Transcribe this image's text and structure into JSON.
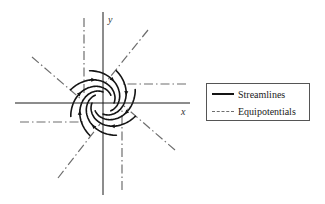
{
  "figure": {
    "type": "spiral vortex flow net",
    "axes": {
      "x_label": "x",
      "y_label": "y",
      "origin": [
        103,
        103
      ],
      "x_extent": [
        15,
        190
      ],
      "y_extent": [
        12,
        195
      ]
    },
    "streamlines": {
      "count": 8,
      "color": "#141414",
      "style": "solid",
      "flow_direction": "clockwise, spiraling inward"
    },
    "equipotentials": {
      "count": 8,
      "color": "#6e6e6e",
      "style": "dash-dot",
      "segments": [
        {
          "from": [
            20,
            122
          ],
          "to": [
            86,
            122
          ]
        },
        {
          "from": [
            84,
            18
          ],
          "to": [
            84,
            96
          ]
        },
        {
          "from": [
            186,
            84
          ],
          "to": [
            120,
            84
          ]
        },
        {
          "from": [
            122,
            190
          ],
          "to": [
            122,
            110
          ]
        },
        {
          "from": [
            32,
            57
          ],
          "to": [
            82,
            100
          ]
        },
        {
          "from": [
            148,
            30
          ],
          "to": [
            106,
            82
          ]
        },
        {
          "from": [
            175,
            150
          ],
          "to": [
            124,
            106
          ]
        },
        {
          "from": [
            58,
            178
          ],
          "to": [
            100,
            124
          ]
        }
      ]
    }
  },
  "legend": {
    "items": [
      {
        "label": "Streamlines",
        "style": "solid"
      },
      {
        "label": "Equipotentials",
        "style": "dashed"
      }
    ]
  }
}
